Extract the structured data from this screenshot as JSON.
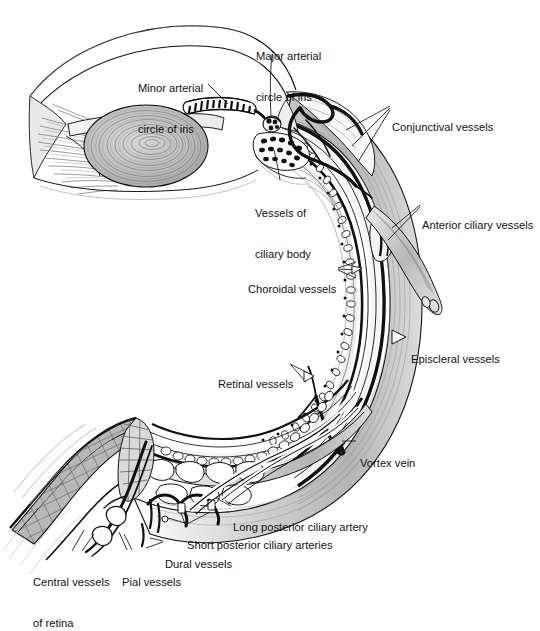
{
  "figure": {
    "type": "anatomical-illustration",
    "background_color": "#ffffff",
    "ink_color": "#111111",
    "sclera_fill": "#c9c9c9",
    "choroid_fill": "#f4f4f4",
    "vessel_black": "#000000",
    "lens_fill": "#b5b5b5",
    "nerve_fill": "#b0b0b0"
  },
  "labels": [
    {
      "id": "minor-arterial-circle-of-iris",
      "lines": [
        "Minor arterial",
        "circle of iris"
      ],
      "x": 138,
      "y": 61,
      "align": "left"
    },
    {
      "id": "major-arterial-circle-of-iris",
      "lines": [
        "Major arterial",
        "circle of iris"
      ],
      "x": 256,
      "y": 29,
      "align": "left"
    },
    {
      "id": "conjunctival-vessels",
      "lines": [
        "Conjunctival vessels"
      ],
      "x": 392,
      "y": 100,
      "align": "left"
    },
    {
      "id": "vessels-of-ciliary-body",
      "lines": [
        "Vessels of",
        "ciliary body"
      ],
      "x": 255,
      "y": 186,
      "align": "left"
    },
    {
      "id": "anterior-ciliary-vessels",
      "lines": [
        "Anterior ciliary vessels"
      ],
      "x": 422,
      "y": 198,
      "align": "left"
    },
    {
      "id": "choroidal-vessels",
      "lines": [
        "Choroidal vessels"
      ],
      "x": 248,
      "y": 262,
      "align": "left"
    },
    {
      "id": "episcleral-vessels",
      "lines": [
        "Episcleral vessels"
      ],
      "x": 411,
      "y": 332,
      "align": "left"
    },
    {
      "id": "retinal-vessels",
      "lines": [
        "Retinal vessels"
      ],
      "x": 218,
      "y": 357,
      "align": "left"
    },
    {
      "id": "vortex-vein",
      "lines": [
        "Vortex vein"
      ],
      "x": 360,
      "y": 436,
      "align": "left"
    },
    {
      "id": "long-posterior-ciliary-artery",
      "lines": [
        "Long posterior ciliary artery"
      ],
      "x": 233,
      "y": 500,
      "align": "left"
    },
    {
      "id": "short-posterior-ciliary-arteries",
      "lines": [
        "Short posterior ciliary arteries"
      ],
      "x": 187,
      "y": 518,
      "align": "left"
    },
    {
      "id": "dural-vessels",
      "lines": [
        "Dural vessels"
      ],
      "x": 165,
      "y": 537,
      "align": "left"
    },
    {
      "id": "pial-vessels",
      "lines": [
        "Pial vessels"
      ],
      "x": 122,
      "y": 555,
      "align": "left"
    },
    {
      "id": "central-vessels-of-retina",
      "lines": [
        "Central vessels",
        "of retina"
      ],
      "x": 33,
      "y": 555,
      "align": "left"
    }
  ],
  "structures": [
    "cornea",
    "anterior-chamber",
    "iris",
    "lens",
    "ciliary-body",
    "zonular-fibres",
    "sclera",
    "choroid",
    "retina",
    "optic-nerve",
    "dural-sheath",
    "extraocular-muscle-tendon",
    "conjunctiva"
  ]
}
